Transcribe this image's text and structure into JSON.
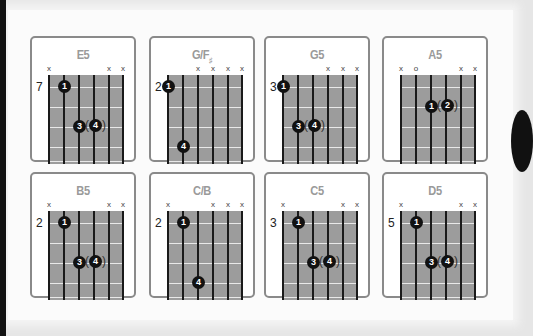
{
  "colors": {
    "card_border": "#8a8a8a",
    "fretboard": "#9c9c9c",
    "string": "#1a1a1a",
    "fret": "#e8e8e8",
    "dot": "#111111",
    "title": "#9a9a9a"
  },
  "chords": [
    {
      "name": "E5",
      "sub": "",
      "fret": "7",
      "marks": [
        "x",
        "",
        "",
        "",
        "x",
        "x"
      ],
      "dots": [
        {
          "s": 1,
          "f": 1,
          "n": "1"
        },
        {
          "s": 2,
          "f": 3,
          "n": "3"
        },
        {
          "s": 3,
          "f": 3,
          "n": "4",
          "paren": true
        }
      ]
    },
    {
      "name": "G/F",
      "sub": "♯",
      "fret": "2",
      "marks": [
        "",
        "",
        "x",
        "x",
        "x",
        "x"
      ],
      "dots": [
        {
          "s": 0,
          "f": 1,
          "n": "1"
        },
        {
          "s": 1,
          "f": 4,
          "n": "4"
        }
      ]
    },
    {
      "name": "G5",
      "sub": "",
      "fret": "3",
      "marks": [
        "",
        "",
        "",
        "x",
        "x",
        "x"
      ],
      "dots": [
        {
          "s": 0,
          "f": 1,
          "n": "1"
        },
        {
          "s": 1,
          "f": 3,
          "n": "3"
        },
        {
          "s": 2,
          "f": 3,
          "n": "4",
          "paren": true
        }
      ]
    },
    {
      "name": "A5",
      "sub": "",
      "fret": "",
      "marks": [
        "x",
        "o",
        "",
        "",
        "x",
        "x"
      ],
      "dots": [
        {
          "s": 2,
          "f": 2,
          "n": "1"
        },
        {
          "s": 3,
          "f": 2,
          "n": "2",
          "paren": true
        }
      ]
    },
    {
      "name": "B5",
      "sub": "",
      "fret": "2",
      "marks": [
        "x",
        "",
        "",
        "",
        "x",
        "x"
      ],
      "dots": [
        {
          "s": 1,
          "f": 1,
          "n": "1"
        },
        {
          "s": 2,
          "f": 3,
          "n": "3"
        },
        {
          "s": 3,
          "f": 3,
          "n": "4",
          "paren": true
        }
      ]
    },
    {
      "name": "C/B",
      "sub": "",
      "fret": "2",
      "marks": [
        "x",
        "",
        "",
        "x",
        "x",
        "x"
      ],
      "dots": [
        {
          "s": 1,
          "f": 1,
          "n": "1"
        },
        {
          "s": 2,
          "f": 4,
          "n": "4"
        }
      ]
    },
    {
      "name": "C5",
      "sub": "",
      "fret": "3",
      "marks": [
        "x",
        "",
        "",
        "",
        "x",
        "x"
      ],
      "dots": [
        {
          "s": 1,
          "f": 1,
          "n": "1"
        },
        {
          "s": 2,
          "f": 3,
          "n": "3"
        },
        {
          "s": 3,
          "f": 3,
          "n": "4",
          "paren": true
        }
      ]
    },
    {
      "name": "D5",
      "sub": "",
      "fret": "5",
      "marks": [
        "x",
        "",
        "",
        "",
        "x",
        "x"
      ],
      "dots": [
        {
          "s": 1,
          "f": 1,
          "n": "1"
        },
        {
          "s": 2,
          "f": 3,
          "n": "3"
        },
        {
          "s": 3,
          "f": 3,
          "n": "4",
          "paren": true
        }
      ]
    }
  ]
}
